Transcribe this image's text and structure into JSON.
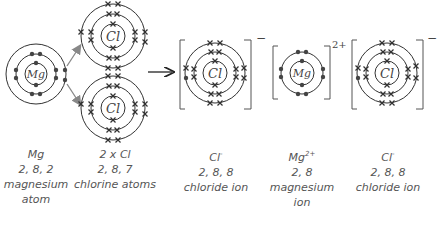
{
  "diagram": {
    "type": "ionic-bonding-dot-cross",
    "reaction_arrow": "→",
    "atoms": [
      {
        "id": "mg-atom",
        "symbol": "Mg",
        "shells": [
          2,
          8,
          2
        ],
        "electron_mark": "dot"
      },
      {
        "id": "cl-atom-top",
        "symbol": "Cl",
        "shells": [
          2,
          8,
          7
        ],
        "electron_mark": "cross"
      },
      {
        "id": "cl-atom-bottom",
        "symbol": "Cl",
        "shells": [
          2,
          8,
          7
        ],
        "electron_mark": "cross"
      }
    ],
    "ions": [
      {
        "id": "chloride-ion-left",
        "symbol": "Cl",
        "charge": "−",
        "shells": [
          2,
          8,
          8
        ]
      },
      {
        "id": "magnesium-ion",
        "symbol": "Mg",
        "charge": "2+",
        "shells": [
          2,
          8
        ]
      },
      {
        "id": "chloride-ion-right",
        "symbol": "Cl",
        "charge": "−",
        "shells": [
          2,
          8,
          8
        ]
      }
    ],
    "colors": {
      "line": "#333333",
      "dot": "#444444",
      "arrow_grey": "#888888"
    }
  },
  "labels": {
    "mg_atom": {
      "formula": "Mg",
      "config": "2, 8, 2",
      "name1": "magnesium",
      "name2": "atom"
    },
    "cl_atoms": {
      "formula": "2 x Cl",
      "config": "2, 8, 7",
      "name1": "chlorine atoms"
    },
    "chloride_left": {
      "formula": "Cl",
      "charge": "-",
      "config": "2, 8, 8",
      "name1": "chloride ion"
    },
    "mg_ion": {
      "formula": "Mg",
      "charge": "2+",
      "config": "2, 8",
      "name1": "magnesium",
      "name2": "ion"
    },
    "chloride_right": {
      "formula": "Cl",
      "charge": "-",
      "config": "2, 8, 8",
      "name1": "chloride ion"
    }
  },
  "symbols": {
    "mg": "Mg",
    "cl": "Cl",
    "minus": "−",
    "two_plus": "2+"
  }
}
